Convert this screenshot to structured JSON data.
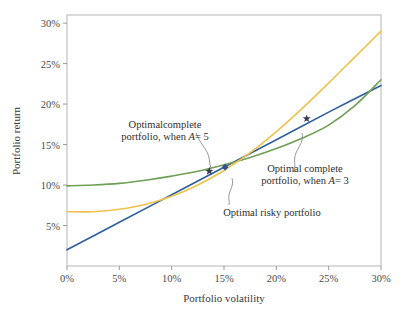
{
  "chart_data": {
    "type": "line",
    "title": "",
    "xlabel": "Portfolio volatility",
    "ylabel": "Portfolio return",
    "xlim": [
      0,
      30
    ],
    "ylim": [
      0,
      31
    ],
    "grid": false,
    "legend": "none",
    "xticks": [
      "0%",
      "5%",
      "10%",
      "15%",
      "20%",
      "25%",
      "30%"
    ],
    "xtick_values": [
      0,
      5,
      10,
      15,
      20,
      25,
      30
    ],
    "yticks": [
      "5%",
      "10%",
      "15%",
      "20%",
      "25%",
      "30%"
    ],
    "ytick_values": [
      5,
      10,
      15,
      20,
      25,
      30
    ],
    "series": [
      {
        "name": "Capital allocation line",
        "color": "#2f5f9e",
        "x": [
          0,
          5,
          10,
          15,
          20,
          25,
          30
        ],
        "values": [
          2.0,
          5.4,
          8.8,
          12.2,
          15.6,
          19.0,
          22.3
        ]
      },
      {
        "name": "Efficient frontier",
        "color": "#6f9f55",
        "x": [
          0,
          2.5,
          5,
          7.5,
          10,
          12.5,
          15,
          17.5,
          20,
          22.5,
          25,
          27.5,
          30
        ],
        "values": [
          9.9,
          10.0,
          10.2,
          10.6,
          11.1,
          11.7,
          12.5,
          13.4,
          14.5,
          15.8,
          17.4,
          19.8,
          23.0
        ]
      },
      {
        "name": "Minimum variance / individual assets curve",
        "color": "#f0c24b",
        "x": [
          0,
          2.5,
          5,
          7.5,
          10,
          12.5,
          15,
          17.5,
          20,
          22.5,
          25,
          27.5,
          30
        ],
        "values": [
          6.7,
          6.7,
          7.0,
          7.6,
          8.6,
          10.0,
          11.8,
          14.0,
          16.6,
          19.5,
          22.6,
          25.8,
          29.0
        ]
      }
    ],
    "markers": [
      {
        "name": "optimal-complete-portfolio-a5",
        "label": "Optimal complete portfolio, when A = 5",
        "shape": "star",
        "color": "#3a3a55",
        "x": 13.6,
        "y": 11.7
      },
      {
        "name": "optimal-risky-portfolio",
        "label": "Optimal risky portfolio",
        "shape": "diamond",
        "color": "#2f4f8f",
        "x": 15.1,
        "y": 12.2
      },
      {
        "name": "optimal-complete-portfolio-a3",
        "label": "Optimal complete portfolio, when A = 3",
        "shape": "star",
        "color": "#3a3a55",
        "x": 22.9,
        "y": 18.2
      }
    ],
    "annotations": [
      {
        "id": "a5",
        "line1": "Optimalcomplete",
        "line2_prefix": "portfolio, when ",
        "variable": "A",
        "line2_suffix": "= 5"
      },
      {
        "id": "a3",
        "line1": "Optimal complete",
        "line2_prefix": "portfolio, when ",
        "variable": "A",
        "line2_suffix": "= 3"
      },
      {
        "id": "risky",
        "line1": "Optimal risky portfolio",
        "line2_prefix": "",
        "variable": "",
        "line2_suffix": ""
      }
    ]
  },
  "colors": {
    "cal_line": "#2f5f9e",
    "efficient_frontier": "#6f9f55",
    "asset_curve": "#f0c24b",
    "axis": "#9a9a9a",
    "text": "#3a3a3a",
    "marker_star": "#3a3a55",
    "marker_diamond": "#2f4f8f",
    "leader": "#8a8a96"
  }
}
